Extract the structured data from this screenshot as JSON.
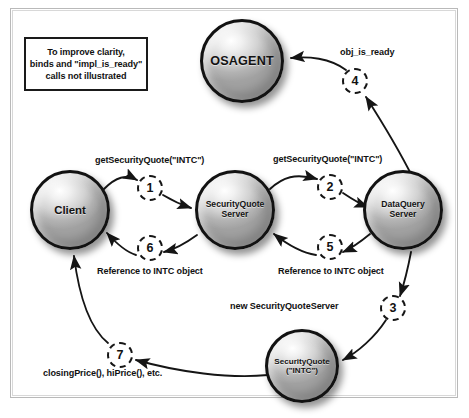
{
  "diagram": {
    "note": {
      "lines": [
        "To improve clarity,",
        "binds and \"impl_is_ready\"",
        "calls not illustrated"
      ]
    },
    "nodes": [
      {
        "id": "osagent",
        "label": "OSAGENT",
        "label2": ""
      },
      {
        "id": "client",
        "label": "Client",
        "label2": ""
      },
      {
        "id": "sqserver",
        "label": "SecurityQuote",
        "label2": "Server"
      },
      {
        "id": "dqserver",
        "label": "DataQuery",
        "label2": "Server"
      },
      {
        "id": "sqintc",
        "label": "SecurityQuote",
        "label2": "(\"INTC\")"
      }
    ],
    "steps": [
      {
        "number": "1",
        "label": "getSecurityQuote(\"INTC\")",
        "from": "client",
        "to": "sqserver"
      },
      {
        "number": "2",
        "label": "getSecurityQuote(\"INTC\")",
        "from": "sqserver",
        "to": "dqserver"
      },
      {
        "number": "3",
        "label": "new SecurityQuoteServer",
        "from": "dqserver",
        "to": "sqintc"
      },
      {
        "number": "4",
        "label": "obj_is_ready",
        "from": "sqintc",
        "to": "osagent"
      },
      {
        "number": "5",
        "label": "Reference to INTC object",
        "from": "dqserver",
        "to": "sqserver"
      },
      {
        "number": "6",
        "label": "Reference to INTC object",
        "from": "sqserver",
        "to": "client"
      },
      {
        "number": "7",
        "label": "closingPrice(), hiPrice(), etc.",
        "from": "sqintc",
        "to": "client"
      }
    ],
    "colors": {
      "frame_border": "#b9b9b9",
      "note_border": "#1a1a1a",
      "node_ring": "#121212",
      "arrow": "#151515",
      "text": "#111111",
      "background": "#ffffff"
    }
  }
}
